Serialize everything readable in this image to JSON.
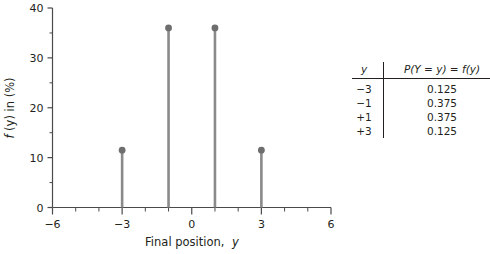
{
  "chart_data": {
    "type": "bar",
    "subtype": "stem",
    "title": "",
    "xlabel": "Final position, y",
    "ylabel": "f(y) in (%)",
    "xlim": [
      -6,
      6
    ],
    "ylim": [
      0,
      40
    ],
    "grid": false,
    "legend": null,
    "x_major_ticks": [
      -6,
      -3,
      0,
      3,
      6
    ],
    "x_major_tick_labels": [
      "−6",
      "−3",
      "0",
      "3",
      "6"
    ],
    "x_minor_tick_step": 1,
    "y_major_ticks": [
      0,
      10,
      20,
      30,
      40
    ],
    "y_major_tick_labels": [
      "0",
      "10",
      "20",
      "30",
      "40"
    ],
    "y_minor_tick_step": 5,
    "categories": [
      -3,
      -1,
      1,
      3
    ],
    "values": [
      11.5,
      36,
      36,
      11.5
    ],
    "marker": "filled-circle",
    "stem_color": "#8a8a8a",
    "marker_color": "#6e6e6e",
    "axis_color": "#4a4a4a"
  },
  "figure": {
    "x_axis_title_plain": "Final position,",
    "x_axis_title_var": "y",
    "y_axis_title_var": "f",
    "y_axis_title_rest": "(y) in (%)"
  },
  "table": {
    "header_y": "y",
    "header_p": "P(Y = y) = f(y)",
    "rows": [
      {
        "y": "−3",
        "p": "0.125"
      },
      {
        "y": "−1",
        "p": "0.375"
      },
      {
        "y": "+1",
        "p": "0.375"
      },
      {
        "y": "+3",
        "p": "0.125"
      }
    ]
  }
}
